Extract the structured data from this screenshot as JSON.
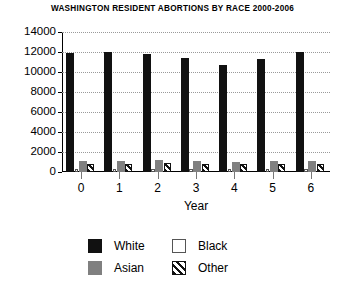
{
  "chart_data": {
    "type": "bar",
    "title": "WASHINGTON RESIDENT ABORTIONS BY RACE 2000-2006",
    "xlabel": "Year",
    "ylabel": "",
    "categories": [
      "0",
      "1",
      "2",
      "3",
      "4",
      "5",
      "6"
    ],
    "ylim": [
      0,
      14000
    ],
    "yticks": [
      0,
      2000,
      4000,
      6000,
      8000,
      10000,
      12000,
      14000
    ],
    "ytick_labels": [
      "0",
      "2000",
      "4000",
      "6000",
      "8000",
      "10000",
      "12000",
      "14000"
    ],
    "grid": true,
    "legend_position": "bottom",
    "series": [
      {
        "name": "White",
        "color": "#111111",
        "fill": "solid",
        "values": [
          11900,
          12000,
          11800,
          11400,
          10700,
          11350,
          12000
        ]
      },
      {
        "name": "Black",
        "color": "#ffffff",
        "fill": "empty",
        "values": [
          330,
          330,
          330,
          330,
          330,
          330,
          330
        ]
      },
      {
        "name": "Asian",
        "color": "#808080",
        "fill": "solid",
        "values": [
          1100,
          1150,
          1200,
          1150,
          1050,
          1100,
          1150
        ]
      },
      {
        "name": "Other",
        "color": "#111111",
        "fill": "hatch",
        "values": [
          780,
          820,
          880,
          840,
          760,
          800,
          850
        ]
      }
    ]
  },
  "legend": {
    "entries": [
      {
        "label": "White"
      },
      {
        "label": "Asian"
      },
      {
        "label": "Black"
      },
      {
        "label": "Other"
      }
    ]
  }
}
